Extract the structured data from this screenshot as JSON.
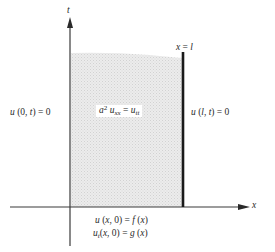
{
  "diagram": {
    "axes": {
      "t_label": "t",
      "x_label": "x"
    },
    "boundary_line_label": {
      "var": "x",
      "eq": " = ",
      "val": "l"
    },
    "left_boundary": {
      "u": "u",
      "args": " (0, ",
      "t": "t",
      "close": ") = 0"
    },
    "right_boundary": {
      "u": "u",
      "open": " (",
      "l": "l",
      "comma": ", ",
      "t": "t",
      "close": ") = 0"
    },
    "pde": {
      "a": "a",
      "exp": "2",
      "u1": " u",
      "sub1": "xx",
      "eq": " = ",
      "u2": "u",
      "sub2": "tt"
    },
    "initial_condition_1": {
      "u": "u",
      "open": " (",
      "x": "x",
      "rest": ", 0) = ",
      "f": "f",
      "open2": " (",
      "x2": "x",
      "close": ")"
    },
    "initial_condition_2": {
      "u": "u",
      "sub": "t",
      "open": "(",
      "x": "x",
      "rest": ", 0) = ",
      "g": "g",
      "open2": " (",
      "x2": "x",
      "close": ")"
    },
    "colors": {
      "axis": "#3a3a3a",
      "boundary": "#1a1a1a",
      "shade": "#e4e4e4"
    }
  }
}
